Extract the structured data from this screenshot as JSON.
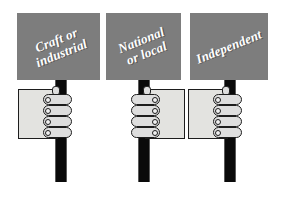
{
  "image": {
    "title": "Three protest placards on poles held by fists",
    "background_color": "#ffffff",
    "placard_color": "#7d7d7d",
    "pole_color": "#0a0a0a",
    "hand_fill_color": "#e3e3e0",
    "finger_fill_color": "#dedede",
    "outline_color": "#1d1d1d",
    "text_color": "#ffffff"
  },
  "signs": [
    {
      "label": "Craft or\nindustrial",
      "line1": "Craft or",
      "line2": "industrial",
      "hand_orientation": "fingers-right"
    },
    {
      "label": "National\nor local",
      "line1": "National",
      "line2": "or local",
      "hand_orientation": "fingers-left"
    },
    {
      "label": "Independent",
      "line1": "Independent",
      "line2": "",
      "hand_orientation": "fingers-right"
    }
  ]
}
